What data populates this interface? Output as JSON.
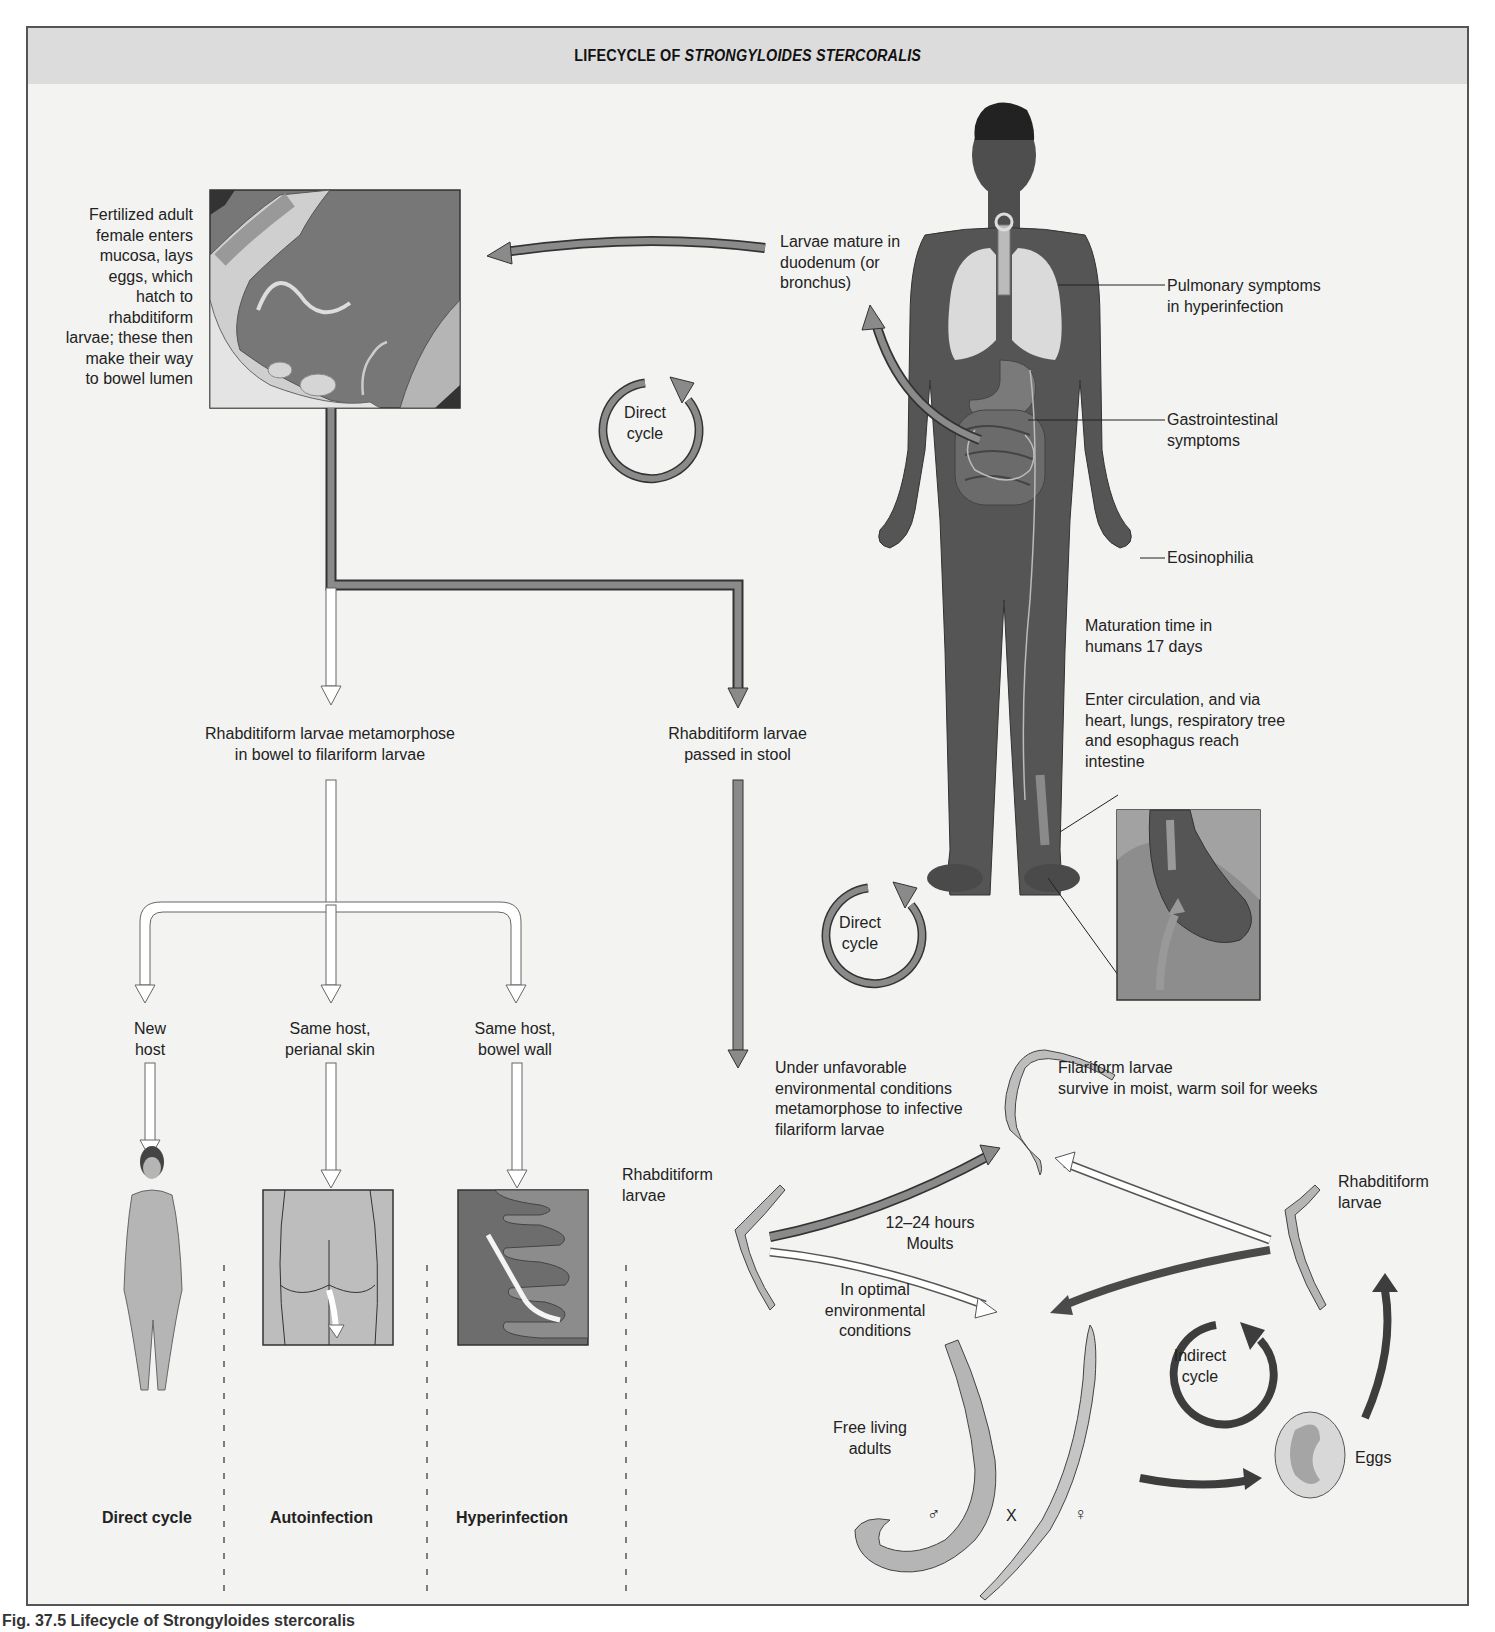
{
  "title": {
    "prefix": "LIFECYCLE OF ",
    "species": "STRONGYLOIDES STERCORALIS"
  },
  "caption": "Fig. 37.5 Lifecycle of Strongyloides stercoralis",
  "labels": {
    "fertilized_female": [
      "Fertilized adult",
      "female enters",
      "mucosa, lays",
      "eggs, which",
      "hatch to",
      "rhabditiform",
      "larvae; these then",
      "make their way",
      "to bowel lumen"
    ],
    "larvae_mature": [
      "Larvae mature in",
      "duodenum (or",
      "bronchus)"
    ],
    "pulmonary": [
      "Pulmonary symptoms",
      "in hyperinfection"
    ],
    "gastrointestinal": [
      "Gastrointestinal",
      "symptoms"
    ],
    "eosinophilia": "Eosinophilia",
    "maturation_time": [
      "Maturation time in",
      "humans 17 days"
    ],
    "enter_circulation": [
      "Enter circulation, and via",
      "heart, lungs, respiratory tree",
      "and esophagus reach",
      "intestine"
    ],
    "direct_cycle_top": [
      "Direct",
      "cycle"
    ],
    "direct_cycle_mid": [
      "Direct",
      "cycle"
    ],
    "indirect_cycle": [
      "Indirect",
      "cycle"
    ],
    "metamorphose_bowel": [
      "Rhabditiform larvae metamorphose",
      "in bowel to filariform larvae"
    ],
    "passed_in_stool": [
      "Rhabditiform larvae",
      "passed in stool"
    ],
    "new_host": [
      "New",
      "host"
    ],
    "perianal": [
      "Same host,",
      "perianal skin"
    ],
    "bowel_wall": [
      "Same host,",
      "bowel wall"
    ],
    "unfavorable": [
      "Under unfavorable",
      "environmental conditions",
      "metamorphose to infective",
      "filariform larvae"
    ],
    "filariform_survive": [
      "Filariform larvae",
      "survive in moist, warm soil for weeks"
    ],
    "rhabditiform_left": [
      "Rhabditiform",
      "larvae"
    ],
    "rhabditiform_right": [
      "Rhabditiform",
      "larvae"
    ],
    "moults": [
      "12–24 hours",
      "Moults"
    ],
    "optimal": [
      "In optimal",
      "environmental",
      "conditions"
    ],
    "free_living": [
      "Free living",
      "adults"
    ],
    "male_symbol": "♂",
    "cross_symbol": "X",
    "female_symbol": "♀",
    "eggs": "Eggs"
  },
  "bottom_row": {
    "direct_cycle": "Direct cycle",
    "autoinfection": "Autoinfection",
    "hyperinfection": "Hyperinfection"
  },
  "colors": {
    "frame_bg": "#f3f3f1",
    "title_bar": "#dcdcdc",
    "body_dark": "#5a5a5a",
    "arrow_mid": "#8a8a8a",
    "arrow_dark": "#4a4a4a",
    "arrow_hollow": "#ffffff"
  }
}
